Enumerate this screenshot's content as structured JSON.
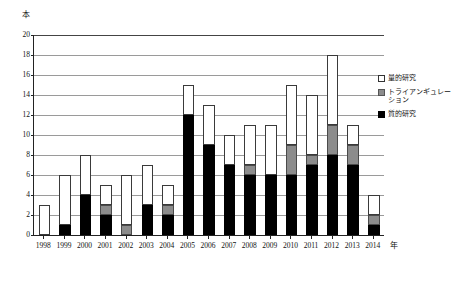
{
  "chart_data": {
    "type": "bar",
    "stacked": true,
    "title": "",
    "xlabel": "年",
    "ylabel": "本",
    "ylim": [
      0,
      20
    ],
    "ytick_step": 2,
    "yticks": [
      "20",
      "18",
      "16",
      "14",
      "12",
      "10",
      "8",
      "6",
      "4",
      "2",
      "0"
    ],
    "grid": true,
    "legend_position": "right",
    "categories": [
      "1998",
      "1999",
      "2000",
      "2001",
      "2002",
      "2003",
      "2004",
      "2005",
      "2006",
      "2007",
      "2008",
      "2009",
      "2010",
      "2011",
      "2012",
      "2013",
      "2014"
    ],
    "series": [
      {
        "name": "質的研究",
        "color": "#000000",
        "values": [
          0,
          1,
          4,
          2,
          0,
          3,
          2,
          12,
          9,
          7,
          6,
          6,
          6,
          7,
          8,
          7,
          1
        ]
      },
      {
        "name": "トライアンギュレーション",
        "color": "#8c8c8c",
        "values": [
          0,
          0,
          0,
          1,
          1,
          0,
          1,
          0,
          0,
          0,
          1,
          0,
          3,
          1,
          3,
          2,
          1
        ]
      },
      {
        "name": "量的研究",
        "color": "#ffffff",
        "values": [
          3,
          5,
          4,
          2,
          5,
          4,
          2,
          3,
          4,
          3,
          4,
          5,
          6,
          6,
          7,
          2,
          2
        ]
      }
    ],
    "totals": [
      3,
      6,
      8,
      5,
      6,
      7,
      5,
      15,
      13,
      10,
      11,
      11,
      15,
      14,
      18,
      11,
      4
    ]
  },
  "axis": {
    "y_unit_label": "本",
    "x_unit_label": "年"
  },
  "legend": {
    "items": [
      {
        "label": "量的研究",
        "swatch": "quant"
      },
      {
        "label": "トライアンギュレーション",
        "swatch": "tri"
      },
      {
        "label": "質的研究",
        "swatch": "qual"
      }
    ]
  }
}
